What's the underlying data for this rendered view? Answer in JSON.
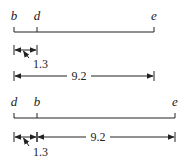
{
  "diagrams": [
    {
      "points": [
        {
          "label": "b",
          "x": 14
        },
        {
          "label": "d",
          "x": 37
        },
        {
          "label": "e",
          "x": 154
        }
      ],
      "line_y": 32,
      "label_y": 20,
      "short_measure": {
        "label": "1.3",
        "from": 14,
        "to": 37,
        "y": 50,
        "label_x": 33,
        "label_y": 68
      },
      "long_measure": {
        "label": "9.2",
        "from": 14,
        "to": 154,
        "y": 76,
        "label_x": 79,
        "label_y": 80
      }
    },
    {
      "points": [
        {
          "label": "d",
          "x": 14
        },
        {
          "label": "b",
          "x": 37
        },
        {
          "label": "e",
          "x": 175
        }
      ],
      "line_y": 118,
      "label_y": 106,
      "short_measure": {
        "label": "1.3",
        "from": 14,
        "to": 37,
        "y": 137,
        "label_x": 33,
        "label_y": 156
      },
      "long_measure": {
        "label": "9.2",
        "from": 37,
        "to": 175,
        "y": 137,
        "label_x": 98,
        "label_y": 141
      }
    }
  ],
  "colors": {
    "stroke": "#222222"
  }
}
